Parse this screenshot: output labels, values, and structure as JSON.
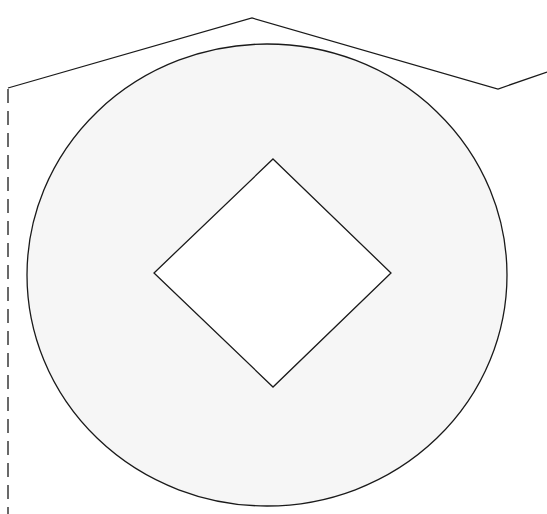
{
  "diagram": {
    "colors": {
      "stroke": "#1a1a1a",
      "ellipse_fill": "#f6f6f6",
      "diamond_fill": "#ffffff",
      "background": "#ffffff"
    },
    "shapes": [
      {
        "id": "outer-ellipse",
        "kind": "ellipse",
        "filled": true
      },
      {
        "id": "inner-diamond",
        "kind": "diamond",
        "filled": true
      },
      {
        "id": "roof-polyline",
        "kind": "polyline",
        "segments": 3
      },
      {
        "id": "left-dashed-line",
        "kind": "line",
        "style": "dashed"
      }
    ],
    "labels": []
  }
}
